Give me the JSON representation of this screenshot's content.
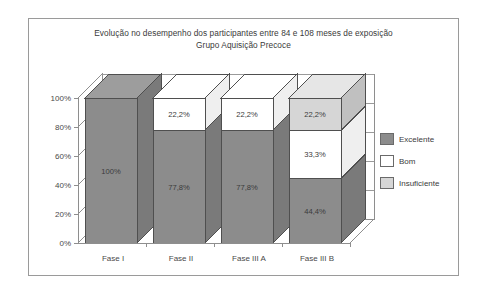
{
  "chart_data": {
    "type": "bar",
    "subtype": "stacked-3d-column",
    "title": "Evolução no desempenho dos participantes entre 84 e 108 meses de exposição",
    "subtitle": "Grupo Aquisição Precoce",
    "xlabel": "",
    "ylabel": "",
    "categories": [
      "Fase I",
      "Fase II",
      "Fase III A",
      "Fase III B"
    ],
    "ylim": [
      0,
      100
    ],
    "yticks": [
      "0%",
      "20%",
      "40%",
      "60%",
      "80%",
      "100%"
    ],
    "ytick_values": [
      0,
      20,
      40,
      60,
      80,
      100
    ],
    "grid": true,
    "legend_position": "right",
    "series": [
      {
        "name": "Excelente",
        "color": "#8c8c8c",
        "values": [
          100,
          77.8,
          77.8,
          44.4
        ],
        "labels": [
          "100%",
          "77,8%",
          "77,8%",
          "44,4%"
        ]
      },
      {
        "name": "Bom",
        "color": "#ffffff",
        "values": [
          0,
          22.2,
          22.2,
          33.3
        ],
        "labels": [
          "",
          "22,2%",
          "22,2%",
          "33,3%"
        ]
      },
      {
        "name": "Insuficiente",
        "color": "#d6d6d6",
        "values": [
          0,
          0,
          0,
          22.2
        ],
        "labels": [
          "",
          "",
          "",
          "22,2%"
        ]
      }
    ]
  },
  "legend": {
    "items": [
      {
        "label": "Excelente",
        "color": "#8c8c8c"
      },
      {
        "label": "Bom",
        "color": "#ffffff"
      },
      {
        "label": "Insuficiente",
        "color": "#d6d6d6"
      }
    ]
  },
  "colors": {
    "excelente": "#8c8c8c",
    "bom": "#ffffff",
    "insuficiente": "#d6d6d6",
    "frame_border": "#9a9a9a",
    "axis": "#8e8e8e",
    "grid": "#9a9a9a",
    "text": "#3b3b3b"
  }
}
